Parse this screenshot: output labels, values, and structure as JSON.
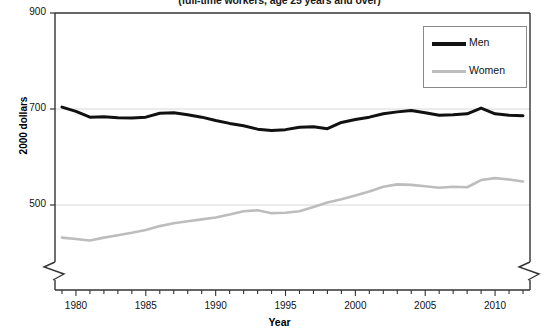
{
  "chart_data": {
    "type": "line",
    "title": "(full-time workers, age 25 years and over)",
    "xlabel": "Year",
    "ylabel": "2000 dollars",
    "ylim": [
      400,
      900
    ],
    "xlim": [
      1978.5,
      2012.5
    ],
    "yticks": [
      "900",
      "700",
      "500"
    ],
    "ytick_values": [
      900,
      700,
      500
    ],
    "xticks": [
      "1980",
      "1985",
      "1990",
      "1995",
      "2000",
      "2005",
      "2010"
    ],
    "xtick_values": [
      1980,
      1985,
      1990,
      1995,
      2000,
      2005,
      2010
    ],
    "grid": "horizontal-gridlines-at-700-and-500",
    "axis_break": "zigzag break on left and right axis below 400",
    "legend_position": "top-right",
    "x": [
      1979,
      1980,
      1981,
      1982,
      1983,
      1984,
      1985,
      1986,
      1987,
      1988,
      1989,
      1990,
      1991,
      1992,
      1993,
      1994,
      1995,
      1996,
      1997,
      1998,
      1999,
      2000,
      2001,
      2002,
      2003,
      2004,
      2005,
      2006,
      2007,
      2008,
      2009,
      2010,
      2011,
      2012
    ],
    "series": [
      {
        "name": "Men",
        "color": "#111111",
        "values": [
          704,
          695,
          683,
          684,
          682,
          681,
          683,
          691,
          692,
          688,
          683,
          676,
          670,
          665,
          658,
          655,
          657,
          662,
          663,
          659,
          672,
          678,
          683,
          690,
          694,
          697,
          692,
          687,
          688,
          690,
          702,
          690,
          687,
          686
        ]
      },
      {
        "name": "Women",
        "color": "#bdbdbd",
        "values": [
          432,
          429,
          426,
          432,
          437,
          442,
          448,
          456,
          462,
          466,
          470,
          474,
          480,
          487,
          489,
          483,
          484,
          487,
          496,
          505,
          512,
          520,
          528,
          538,
          543,
          542,
          539,
          536,
          538,
          537,
          552,
          556,
          553,
          549
        ]
      }
    ]
  },
  "legend": {
    "items": [
      {
        "label": "Men"
      },
      {
        "label": "Women"
      }
    ]
  }
}
